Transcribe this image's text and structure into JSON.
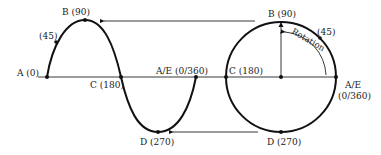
{
  "sine_labels": {
    "a": "A  (0)",
    "p45": "(45)",
    "b": "B  (90)",
    "c": "C  (180)",
    "d": "D  (270)",
    "ae": "A/E  (0/360)"
  },
  "circle_labels": {
    "b": "B  (90)",
    "p45": "(45)",
    "c": "C  (180)",
    "d": "D  (270)",
    "ae_top": "A/E",
    "ae_bottom": "(0/360)",
    "rotation": "Rotation"
  },
  "colors": {
    "line": "#111111",
    "background": "#ffffff"
  }
}
